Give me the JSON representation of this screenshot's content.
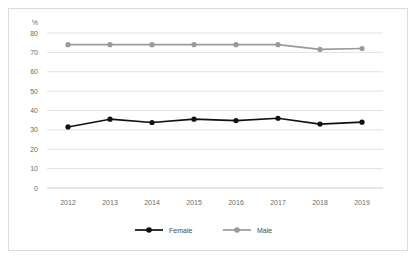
{
  "figure": {
    "background_color": "#ffffff",
    "frame_color": "#dcdcdc",
    "unit_label": "%"
  },
  "chart_data": {
    "type": "line",
    "title": "",
    "xlabel": "",
    "ylabel": "%",
    "categories": [
      "2012",
      "2013",
      "2014",
      "2015",
      "2016",
      "2017",
      "2018",
      "2019"
    ],
    "x": [
      2012,
      2013,
      2014,
      2015,
      2016,
      2017,
      2018,
      2019
    ],
    "ylim": [
      0,
      80
    ],
    "yticks": [
      "0",
      "10",
      "20",
      "30",
      "40",
      "50",
      "60",
      "70",
      "80"
    ],
    "ytick_values": [
      0,
      10,
      20,
      30,
      40,
      50,
      60,
      70,
      80
    ],
    "grid": true,
    "legend_position": "bottom",
    "series": [
      {
        "name": "Female",
        "color": "#111111",
        "marker": "circle",
        "values": [
          31.5,
          35.5,
          33.8,
          35.5,
          34.8,
          36.0,
          33.0,
          34.0
        ]
      },
      {
        "name": "Male",
        "color": "#9a9a9a",
        "marker": "circle",
        "values": [
          74.0,
          74.0,
          74.0,
          74.0,
          74.0,
          74.0,
          71.5,
          72.0
        ]
      }
    ]
  },
  "legend": {
    "items": [
      {
        "label": "Female",
        "color": "#111111"
      },
      {
        "label": "Male",
        "color": "#9a9a9a"
      }
    ]
  }
}
